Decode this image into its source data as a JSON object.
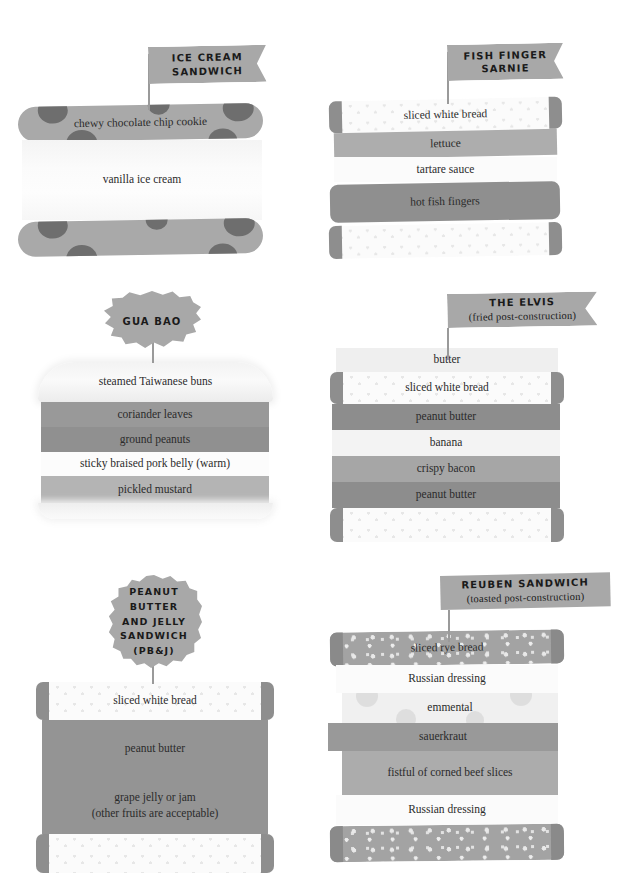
{
  "poster": {
    "title": "Sandwich cross-section diagrams",
    "palette": {
      "banner": "#a8a8a8",
      "ink": "#2b2b2b",
      "crust": "#8e8e8e",
      "cookie": "#a9a9a9",
      "chocolate_chip": "#6e6e6e",
      "background": "#ffffff"
    }
  },
  "sandwiches": [
    {
      "id": "ice-cream-sandwich",
      "label_lines": [
        "ICE CREAM",
        "SANDWICH"
      ],
      "label_shape": "flag-notched",
      "layers": [
        {
          "name": "chewy chocolate chip cookie",
          "style": "cookie"
        },
        {
          "name": "vanilla ice cream",
          "style": "ice-cream"
        },
        {
          "name": "",
          "style": "cookie"
        }
      ]
    },
    {
      "id": "fish-finger-sarnie",
      "label_lines": [
        "FISH FINGER",
        "SARNIE"
      ],
      "label_shape": "flag-notched",
      "layers": [
        {
          "name": "sliced white bread",
          "style": "speckled-bread",
          "color": "#e4e4e4"
        },
        {
          "name": "lettuce",
          "style": "solid",
          "color": "#adadad"
        },
        {
          "name": "tartare sauce",
          "style": "solid",
          "color": "#fbfbfb"
        },
        {
          "name": "hot fish fingers",
          "style": "solid-rounded",
          "color": "#8f8f8f"
        },
        {
          "name": "",
          "style": "speckled-bread",
          "color": "#e9e9e9"
        }
      ]
    },
    {
      "id": "gua-bao",
      "label_lines": [
        "GUA BAO"
      ],
      "label_shape": "badge-cloud",
      "layers": [
        {
          "name": "steamed Taiwanese buns",
          "style": "bun",
          "color": "#f6f6f6"
        },
        {
          "name": "coriander leaves",
          "style": "solid",
          "color": "#999999"
        },
        {
          "name": "ground peanuts",
          "style": "solid",
          "color": "#909090"
        },
        {
          "name": "sticky braised pork belly (warm)",
          "style": "solid",
          "color": "#fcfcfc"
        },
        {
          "name": "pickled mustard",
          "style": "solid",
          "color": "#b4b4b4"
        },
        {
          "name": "",
          "style": "bun-bottom",
          "color": "#f2f2f2"
        }
      ]
    },
    {
      "id": "the-elvis",
      "label_lines": [
        "THE ELVIS"
      ],
      "label_sub": "(fried post-construction)",
      "label_shape": "flag-notched",
      "layers": [
        {
          "name": "butter",
          "style": "solid",
          "color": "#efefef"
        },
        {
          "name": "sliced white bread",
          "style": "speckled-bread",
          "color": "#fafafa"
        },
        {
          "name": "peanut butter",
          "style": "solid",
          "color": "#8d8d8d"
        },
        {
          "name": "banana",
          "style": "solid",
          "color": "#f3f3f3"
        },
        {
          "name": "crispy bacon",
          "style": "solid",
          "color": "#a6a6a6"
        },
        {
          "name": "peanut butter",
          "style": "solid",
          "color": "#8d8d8d"
        },
        {
          "name": "",
          "style": "speckled-bread",
          "color": "#fbfbfb"
        }
      ]
    },
    {
      "id": "peanut-butter-and-jelly-sandwich",
      "label_lines": [
        "PEANUT",
        "BUTTER",
        "AND JELLY",
        "SANDWICH",
        "(PB&J)"
      ],
      "label_shape": "badge-round",
      "layers": [
        {
          "name": "sliced white bread",
          "style": "speckled-bread",
          "color": "#fbfbfb"
        },
        {
          "name": "peanut butter",
          "style": "solid",
          "color": "#949494"
        },
        {
          "name": "grape jelly or jam",
          "style": "solid",
          "color": "#949494"
        },
        {
          "name": "(other fruits are acceptable)",
          "style": "caption",
          "color": "#949494"
        },
        {
          "name": "",
          "style": "speckled-bread",
          "color": "#fbfbfb"
        }
      ]
    },
    {
      "id": "reuben-sandwich",
      "label_lines": [
        "REUBEN SANDWICH"
      ],
      "label_sub": "(toasted post-construction)",
      "label_shape": "rect",
      "layers": [
        {
          "name": "sliced rye bread",
          "style": "speckled-rye",
          "color": "#a3a3a3"
        },
        {
          "name": "Russian dressing",
          "style": "solid",
          "color": "#fbfbfb"
        },
        {
          "name": "emmental",
          "style": "holes",
          "color": "#f0f0f0"
        },
        {
          "name": "sauerkraut",
          "style": "solid",
          "color": "#999999"
        },
        {
          "name": "fistful of corned beef slices",
          "style": "solid",
          "color": "#acacac"
        },
        {
          "name": "Russian dressing",
          "style": "solid",
          "color": "#fbfbfb"
        },
        {
          "name": "",
          "style": "speckled-rye",
          "color": "#a3a3a3"
        }
      ]
    }
  ]
}
